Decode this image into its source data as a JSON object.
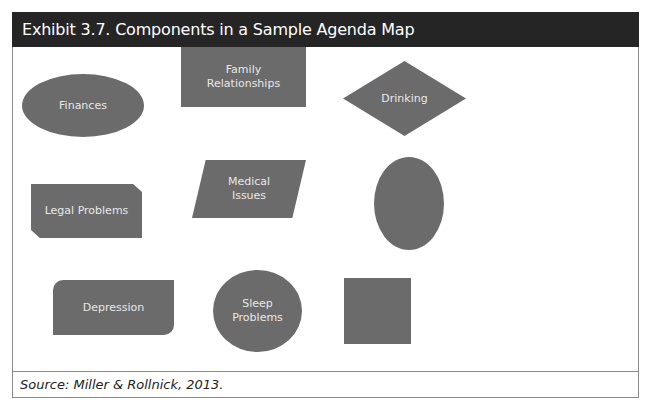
{
  "exhibit": {
    "title": "Exhibit 3.7. Components in a Sample Agenda Map",
    "source": "Source: Miller & Rollnick, 2013."
  },
  "colors": {
    "header_bg": "#252525",
    "shape_fill": "#6b6b6b",
    "shape_text": "#e8e8e8",
    "border": "#8a8a8a"
  },
  "shapes": [
    {
      "id": "finances",
      "type": "ellipse",
      "label": "Finances"
    },
    {
      "id": "family",
      "type": "rectangle",
      "label": "Family Relationships"
    },
    {
      "id": "drinking",
      "type": "diamond",
      "label": "Drinking"
    },
    {
      "id": "legal",
      "type": "snipped-rectangle",
      "label": "Legal Problems"
    },
    {
      "id": "medical",
      "type": "parallelogram",
      "label": "Medical Issues"
    },
    {
      "id": "blank-oval",
      "type": "ellipse",
      "label": ""
    },
    {
      "id": "depression",
      "type": "rounded-diagonal-rectangle",
      "label": "Depression"
    },
    {
      "id": "sleep",
      "type": "circle",
      "label": "Sleep Problems"
    },
    {
      "id": "blank-square",
      "type": "square",
      "label": ""
    }
  ]
}
